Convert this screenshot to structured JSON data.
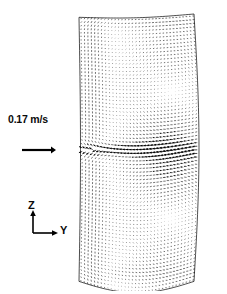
{
  "figure": {
    "title": "Velocity vector field",
    "background_color": "#ffffff",
    "ink_color": "#000000",
    "width": 227,
    "height": 294
  },
  "legend": {
    "scale_label": "0.17 m/s",
    "scale_value": 0.17,
    "scale_units": "m/s",
    "scale_bar_name": "reference-vector-arrow",
    "scale_bar_length_px": 30
  },
  "axis_indicator": {
    "vertical_label": "Z",
    "horizontal_label": "Y",
    "corner_style": "L"
  },
  "chart_data": {
    "type": "scatter",
    "subtype": "vector-field-quiver",
    "title": "",
    "xlabel": "Y",
    "ylabel": "Z",
    "grid": false,
    "legend_position": "left",
    "reference_vector": {
      "magnitude": 0.17,
      "units": "m/s",
      "label": "0.17 m/s"
    },
    "domain": {
      "shape": "curved-rectangular-duct-cross-section",
      "perspective": "3d-oblique",
      "x_left_px": 79,
      "x_right_px": 195,
      "y_top_px": 14,
      "y_bottom_px": 283,
      "top_edge_slant_px": 6,
      "bottom_arc_depth_px": 13,
      "right_edge_bulge_px": 5
    },
    "vortices": [
      {
        "name": "upper-vortex",
        "center_x_px": 172,
        "center_y_px": 100,
        "rotation": "clockwise",
        "strength": 1.0,
        "radius_x_px": 36,
        "radius_y_px": 56
      },
      {
        "name": "lower-vortex",
        "center_x_px": 170,
        "center_y_px": 211,
        "rotation": "counter-clockwise",
        "strength": 1.0,
        "radius_x_px": 36,
        "radius_y_px": 58
      }
    ],
    "midplane": {
      "name": "impingement-midplane",
      "y_px": 150,
      "description": "dense dark band of strong horizontal vectors where the two counter-rotating cells meet"
    },
    "grid_resolution": {
      "columns": 34,
      "rows": 74
    },
    "max_speed": 0.17,
    "series": [
      {
        "name": "velocity",
        "components": [
          "v_y",
          "v_z"
        ],
        "units": "m/s"
      }
    ]
  }
}
